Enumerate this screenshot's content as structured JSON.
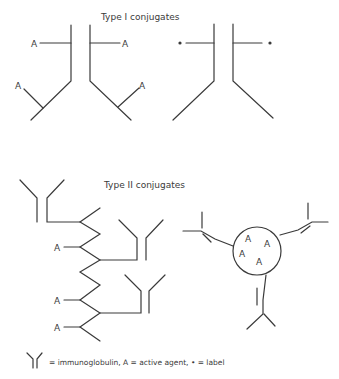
{
  "type1": {
    "title": "Type I  conjugates",
    "active_label": "A",
    "label_marker": "•"
  },
  "type2": {
    "title": "Type II  conjugates",
    "active_label": "A"
  },
  "legend": {
    "text": "=  immunoglobulin, A = active agent, • = label"
  },
  "colors": {
    "ink": "#3a3a3a",
    "background": "#ffffff"
  }
}
